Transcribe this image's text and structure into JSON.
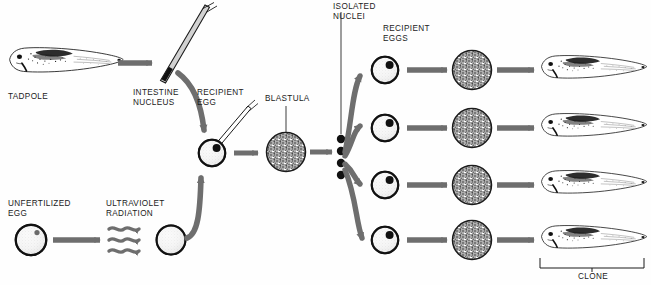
{
  "figure": {
    "title_hidden": "Nuclear transplantation cloning of frogs",
    "background_color": "#fefefe",
    "arrow_color": "#6e6e6e",
    "ink_color": "#1b1b1b",
    "egg_fill": "#f2f2f2",
    "nucleus_color": "#111111"
  },
  "labels": {
    "tadpole": "TADPOLE",
    "intestine_nucleus": "INTESTINE\nNUCLEUS",
    "recipient_egg": "RECIPIENT\nEGG",
    "blastula": "BLASTULA",
    "isolated_nuclei": "ISOLATED\nNUCLEI",
    "recipient_eggs": "RECIPIENT\nEGGS",
    "unfertilized_egg": "UNFERTILIZED\nEGG",
    "ultraviolet_radiation": "ULTRAVIOLET\nRADIATION",
    "clone": "CLONE"
  },
  "flow": {
    "top_row": [
      {
        "name": "tadpole",
        "kind": "tadpole-illustration"
      },
      {
        "name": "pipette-with-intestine-nucleus",
        "kind": "micropipette"
      },
      {
        "name": "recipient-egg",
        "kind": "egg-with-pipette"
      },
      {
        "name": "blastula",
        "kind": "blastula-sphere"
      },
      {
        "name": "isolated-nuclei",
        "kind": "nuclei-dots",
        "count": 4
      }
    ],
    "bottom_row": [
      {
        "name": "unfertilized-egg",
        "kind": "egg-with-nucleus"
      },
      {
        "name": "ultraviolet-radiation",
        "kind": "wavy-arrows",
        "count": 3
      },
      {
        "name": "enucleated-egg",
        "kind": "blank-egg"
      }
    ],
    "clone_rows": [
      {
        "row": 1,
        "egg": "recipient-egg",
        "blastula": "blastula-sphere",
        "tadpole": "clone-tadpole"
      },
      {
        "row": 2,
        "egg": "recipient-egg",
        "blastula": "blastula-sphere",
        "tadpole": "clone-tadpole"
      },
      {
        "row": 3,
        "egg": "recipient-egg",
        "blastula": "blastula-sphere",
        "tadpole": "clone-tadpole"
      },
      {
        "row": 4,
        "egg": "recipient-egg",
        "blastula": "blastula-sphere",
        "tadpole": "clone-tadpole"
      }
    ],
    "clone_bracket": {
      "covers_rows": 4,
      "label": "CLONE"
    }
  }
}
